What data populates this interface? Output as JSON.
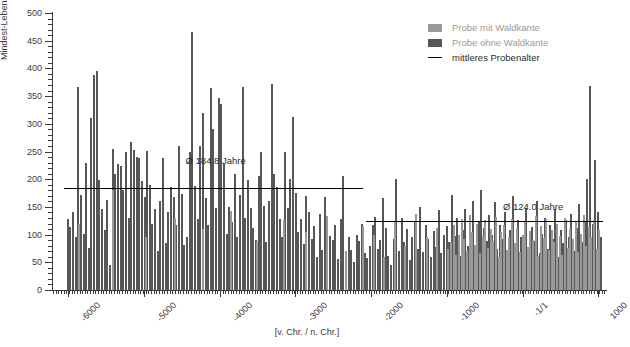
{
  "chart_data": {
    "type": "bar",
    "title": "",
    "xlabel": "[v. Chr. / n. Chr.]",
    "ylabel": "Mindest-Lebensalter der Bäume [Jahre]",
    "xlim": [
      -6200,
      1100
    ],
    "ylim": [
      0,
      500
    ],
    "grid": false,
    "legend_position": "top-right",
    "y_ticks": [
      0,
      50,
      100,
      150,
      200,
      250,
      300,
      350,
      400,
      450,
      500
    ],
    "y_tick_labels": [
      "0",
      "50",
      "100",
      "150",
      "200",
      "250",
      "300",
      "350",
      "400",
      "450",
      "500"
    ],
    "y_minor_step": 10,
    "x_ticks": [
      -6000,
      -5000,
      -4000,
      -3000,
      -2000,
      -1000,
      0,
      1000
    ],
    "x_tick_labels": [
      "-6000",
      "-5000",
      "-4000",
      "-3000",
      "-2000",
      "-1000",
      "-1/1",
      "1000"
    ],
    "legend": [
      {
        "name": "Probe mit Waldkante",
        "color": "#999999",
        "marker": "swatch"
      },
      {
        "name": "Probe ohne Waldkante",
        "color": "#575757",
        "marker": "swatch"
      },
      {
        "name": "mittleres Probenalter",
        "color": "#000000",
        "marker": "line"
      }
    ],
    "annotations": [
      {
        "text": "Ø 184.8 Jahre",
        "x": -4450,
        "y": 243
      },
      {
        "text": "Ø 124.0 Jahre",
        "x": -260,
        "y": 160
      }
    ],
    "mean_lines": [
      {
        "label": "Ø 184.8 Jahre",
        "value": 184.8,
        "x_start": -6050,
        "x_end": -2110
      },
      {
        "label": "Ø 124.0 Jahre",
        "value": 124.0,
        "x_start": -2070,
        "x_end": 1060
      }
    ],
    "series": [
      {
        "name": "Probe ohne Waldkante",
        "color": "#575757",
        "points": [
          [
            -6020,
            128
          ],
          [
            -5985,
            113
          ],
          [
            -5950,
            140
          ],
          [
            -5915,
            96
          ],
          [
            -5880,
            367
          ],
          [
            -5845,
            172
          ],
          [
            -5810,
            102
          ],
          [
            -5775,
            230
          ],
          [
            -5740,
            75
          ],
          [
            -5705,
            311
          ],
          [
            -5670,
            388
          ],
          [
            -5635,
            395
          ],
          [
            -5600,
            198
          ],
          [
            -5565,
            146
          ],
          [
            -5530,
            108
          ],
          [
            -5495,
            163
          ],
          [
            -5460,
            45
          ],
          [
            -5425,
            255
          ],
          [
            -5390,
            210
          ],
          [
            -5355,
            228
          ],
          [
            -5320,
            224
          ],
          [
            -5285,
            180
          ],
          [
            -5250,
            250
          ],
          [
            -5215,
            130
          ],
          [
            -5180,
            268
          ],
          [
            -5145,
            252
          ],
          [
            -5110,
            240
          ],
          [
            -5075,
            238
          ],
          [
            -5040,
            196
          ],
          [
            -5005,
            168
          ],
          [
            -4970,
            251
          ],
          [
            -4935,
            190
          ],
          [
            -4900,
            120
          ],
          [
            -4865,
            146
          ],
          [
            -4830,
            70
          ],
          [
            -4795,
            160
          ],
          [
            -4760,
            238
          ],
          [
            -4725,
            84
          ],
          [
            -4690,
            140
          ],
          [
            -4655,
            186
          ],
          [
            -4620,
            168
          ],
          [
            -4585,
            118
          ],
          [
            -4550,
            260
          ],
          [
            -4515,
            174
          ],
          [
            -4480,
            82
          ],
          [
            -4445,
            96
          ],
          [
            -4410,
            250
          ],
          [
            -4375,
            465
          ],
          [
            -4340,
            188
          ],
          [
            -4305,
            128
          ],
          [
            -4270,
            260
          ],
          [
            -4235,
            320
          ],
          [
            -4200,
            166
          ],
          [
            -4165,
            118
          ],
          [
            -4130,
            365
          ],
          [
            -4095,
            290
          ],
          [
            -4060,
            148
          ],
          [
            -4025,
            347
          ],
          [
            -3990,
            336
          ],
          [
            -3955,
            228
          ],
          [
            -3920,
            102
          ],
          [
            -3885,
            150
          ],
          [
            -3850,
            122
          ],
          [
            -3815,
            210
          ],
          [
            -3780,
            95
          ],
          [
            -3745,
            172
          ],
          [
            -3710,
            367
          ],
          [
            -3675,
            130
          ],
          [
            -3640,
            198
          ],
          [
            -3605,
            148
          ],
          [
            -3570,
            112
          ],
          [
            -3535,
            90
          ],
          [
            -3500,
            206
          ],
          [
            -3465,
            250
          ],
          [
            -3430,
            152
          ],
          [
            -3395,
            86
          ],
          [
            -3360,
            160
          ],
          [
            -3325,
            372
          ],
          [
            -3290,
            210
          ],
          [
            -3255,
            186
          ],
          [
            -3220,
            128
          ],
          [
            -3185,
            96
          ],
          [
            -3150,
            250
          ],
          [
            -3115,
            148
          ],
          [
            -3080,
            200
          ],
          [
            -3045,
            312
          ],
          [
            -3010,
            175
          ],
          [
            -2975,
            104
          ],
          [
            -2940,
            128
          ],
          [
            -2905,
            83
          ],
          [
            -2870,
            170
          ],
          [
            -2835,
            140
          ],
          [
            -2800,
            92
          ],
          [
            -2765,
            115
          ],
          [
            -2730,
            60
          ],
          [
            -2695,
            138
          ],
          [
            -2660,
            72
          ],
          [
            -2625,
            168
          ],
          [
            -2590,
            124
          ],
          [
            -2555,
            98
          ],
          [
            -2520,
            90
          ],
          [
            -2485,
            118
          ],
          [
            -2450,
            56
          ],
          [
            -2415,
            128
          ],
          [
            -2380,
            205
          ],
          [
            -2345,
            60
          ],
          [
            -2310,
            95
          ],
          [
            -2275,
            72
          ],
          [
            -2240,
            50
          ],
          [
            -2205,
            100
          ],
          [
            -2170,
            88
          ],
          [
            -2135,
            120
          ],
          [
            -2100,
            66
          ],
          [
            -2065,
            58
          ],
          [
            -2030,
            80
          ],
          [
            -1995,
            118
          ],
          [
            -1960,
            132
          ],
          [
            -1925,
            74
          ],
          [
            -1890,
            90
          ],
          [
            -1855,
            166
          ],
          [
            -1820,
            112
          ],
          [
            -1785,
            62
          ],
          [
            -1750,
            45
          ],
          [
            -1715,
            92
          ],
          [
            -1680,
            200
          ],
          [
            -1645,
            70
          ],
          [
            -1610,
            130
          ],
          [
            -1575,
            86
          ],
          [
            -1540,
            110
          ],
          [
            -1505,
            55
          ],
          [
            -1470,
            96
          ],
          [
            -1435,
            124
          ],
          [
            -1400,
            74
          ],
          [
            -1365,
            150
          ],
          [
            -1330,
            68
          ],
          [
            -1295,
            118
          ],
          [
            -1260,
            92
          ],
          [
            -1225,
            60
          ],
          [
            -1190,
            106
          ],
          [
            -1155,
            78
          ],
          [
            -1120,
            144
          ],
          [
            -1085,
            66
          ],
          [
            -1050,
            100
          ],
          [
            -1015,
            116
          ],
          [
            -980,
            86
          ],
          [
            -945,
            172
          ],
          [
            -910,
            98
          ],
          [
            -875,
            130
          ],
          [
            -840,
            62
          ],
          [
            -805,
            108
          ],
          [
            -770,
            146
          ],
          [
            -735,
            80
          ],
          [
            -700,
            94
          ],
          [
            -665,
            160
          ],
          [
            -630,
            70
          ],
          [
            -595,
            122
          ],
          [
            -560,
            180
          ],
          [
            -525,
            112
          ],
          [
            -490,
            88
          ],
          [
            -455,
            136
          ],
          [
            -420,
            100
          ],
          [
            -385,
            158
          ],
          [
            -350,
            74
          ],
          [
            -315,
            118
          ],
          [
            -280,
            92
          ],
          [
            -245,
            140
          ],
          [
            -210,
            60
          ],
          [
            -175,
            108
          ],
          [
            -140,
            170
          ],
          [
            -105,
            82
          ],
          [
            -70,
            126
          ],
          [
            -35,
            96
          ],
          [
            0,
            56
          ],
          [
            35,
            148
          ],
          [
            70,
            70
          ],
          [
            105,
            114
          ],
          [
            140,
            88
          ],
          [
            175,
            160
          ],
          [
            210,
            66
          ],
          [
            245,
            102
          ],
          [
            280,
            130
          ],
          [
            315,
            74
          ],
          [
            350,
            118
          ],
          [
            385,
            92
          ],
          [
            420,
            146
          ],
          [
            455,
            60
          ],
          [
            490,
            108
          ],
          [
            525,
            84
          ],
          [
            560,
            126
          ],
          [
            595,
            96
          ],
          [
            630,
            138
          ],
          [
            665,
            70
          ],
          [
            700,
            112
          ],
          [
            735,
            155
          ],
          [
            770,
            86
          ],
          [
            805,
            122
          ],
          [
            840,
            200
          ],
          [
            875,
            368
          ],
          [
            910,
            120
          ],
          [
            945,
            235
          ],
          [
            980,
            140
          ],
          [
            1015,
            96
          ]
        ]
      },
      {
        "name": "Probe mit Waldkante",
        "color": "#999999",
        "points": [
          [
            -5865,
            120
          ],
          [
            -5420,
            180
          ],
          [
            -4980,
            96
          ],
          [
            -4600,
            130
          ],
          [
            -4230,
            110
          ],
          [
            -3870,
            142
          ],
          [
            -3520,
            88
          ],
          [
            -3160,
            126
          ],
          [
            -2880,
            105
          ],
          [
            -2600,
            134
          ],
          [
            -2350,
            70
          ],
          [
            -2120,
            115
          ],
          [
            -1980,
            100
          ],
          [
            -1840,
            60
          ],
          [
            -1700,
            124
          ],
          [
            -1560,
            80
          ],
          [
            -1420,
            138
          ],
          [
            -1280,
            96
          ],
          [
            -1140,
            112
          ],
          [
            -1000,
            74
          ],
          [
            -960,
            86
          ],
          [
            -925,
            118
          ],
          [
            -890,
            64
          ],
          [
            -855,
            100
          ],
          [
            -820,
            128
          ],
          [
            -785,
            92
          ],
          [
            -750,
            70
          ],
          [
            -715,
            136
          ],
          [
            -680,
            104
          ],
          [
            -645,
            82
          ],
          [
            -610,
            120
          ],
          [
            -575,
            66
          ],
          [
            -540,
            98
          ],
          [
            -505,
            126
          ],
          [
            -470,
            76
          ],
          [
            -435,
            110
          ],
          [
            -400,
            88
          ],
          [
            -365,
            132
          ],
          [
            -330,
            60
          ],
          [
            -295,
            104
          ],
          [
            -260,
            118
          ],
          [
            -225,
            72
          ],
          [
            -190,
            96
          ],
          [
            -155,
            128
          ],
          [
            -120,
            84
          ],
          [
            -85,
            112
          ],
          [
            -50,
            68
          ],
          [
            -15,
            100
          ],
          [
            20,
            122
          ],
          [
            55,
            78
          ],
          [
            90,
            106
          ],
          [
            125,
            90
          ],
          [
            160,
            134
          ],
          [
            195,
            62
          ],
          [
            230,
            116
          ],
          [
            265,
            94
          ],
          [
            300,
            128
          ],
          [
            335,
            72
          ],
          [
            370,
            108
          ],
          [
            405,
            86
          ],
          [
            440,
            120
          ],
          [
            475,
            98
          ],
          [
            510,
            64
          ],
          [
            545,
            130
          ],
          [
            580,
            76
          ],
          [
            615,
            110
          ],
          [
            650,
            92
          ],
          [
            685,
            124
          ],
          [
            720,
            68
          ],
          [
            755,
            102
          ],
          [
            790,
            136
          ],
          [
            825,
            80
          ],
          [
            860,
            114
          ],
          [
            895,
            96
          ],
          [
            930,
            126
          ],
          [
            965,
            74
          ],
          [
            1000,
            108
          ]
        ]
      }
    ]
  }
}
